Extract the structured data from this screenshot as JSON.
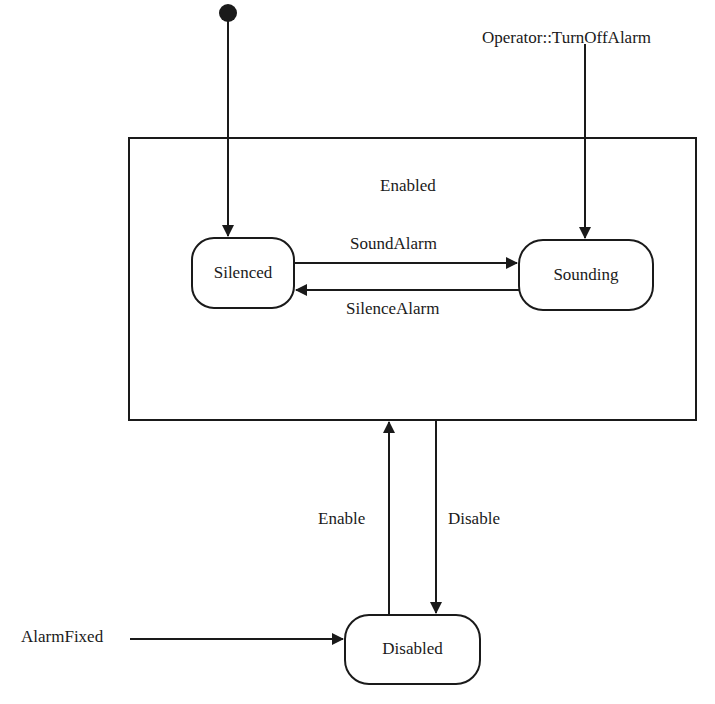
{
  "diagram": {
    "type": "uml-state-machine",
    "stroke_color": "#1a1a1a",
    "background": "#ffffff",
    "composite_state": {
      "label": "Enabled"
    },
    "states": [
      {
        "id": "silenced",
        "label": "Silenced"
      },
      {
        "id": "sounding",
        "label": "Sounding"
      },
      {
        "id": "disabled",
        "label": "Disabled"
      }
    ],
    "initial_pseudostate": {
      "target": "Silenced"
    },
    "transitions": [
      {
        "from": "Silenced",
        "to": "Sounding",
        "label": "SoundAlarm"
      },
      {
        "from": "Sounding",
        "to": "Silenced",
        "label": "SilenceAlarm"
      },
      {
        "from": "Disabled",
        "to": "Enabled",
        "label": "Enable"
      },
      {
        "from": "Enabled",
        "to": "Disabled",
        "label": "Disable"
      },
      {
        "from": "external",
        "to": "Sounding",
        "label": "Operator::TurnOffAlarm"
      },
      {
        "from": "external",
        "to": "Disabled",
        "label": "AlarmFixed"
      }
    ]
  }
}
